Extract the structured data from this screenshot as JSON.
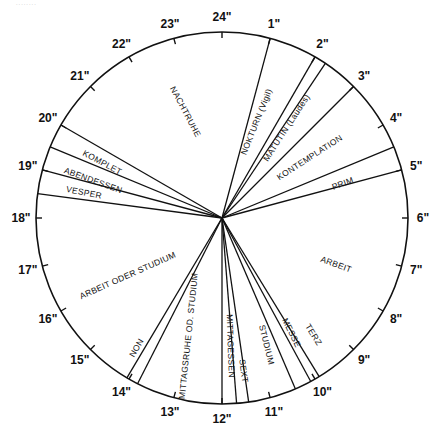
{
  "diagram": {
    "type": "24-hour clock day schedule",
    "caption_scrap": "........",
    "center": [
      222,
      218
    ],
    "radius": 186,
    "stroke_color": "#111111",
    "background": "#ffffff",
    "hour_ticks": [
      {
        "hour": 24,
        "label": "24\""
      },
      {
        "hour": 1,
        "label": "1\""
      },
      {
        "hour": 2,
        "label": "2\""
      },
      {
        "hour": 3,
        "label": "3\""
      },
      {
        "hour": 4,
        "label": "4\""
      },
      {
        "hour": 5,
        "label": "5\""
      },
      {
        "hour": 6,
        "label": "6\""
      },
      {
        "hour": 7,
        "label": "7\""
      },
      {
        "hour": 8,
        "label": "8\""
      },
      {
        "hour": 9,
        "label": "9\""
      },
      {
        "hour": 10,
        "label": "10\""
      },
      {
        "hour": 11,
        "label": "11\""
      },
      {
        "hour": 12,
        "label": "12\""
      },
      {
        "hour": 13,
        "label": "13\""
      },
      {
        "hour": 14,
        "label": "14\""
      },
      {
        "hour": 15,
        "label": "15\""
      },
      {
        "hour": 16,
        "label": "16\""
      },
      {
        "hour": 17,
        "label": "17\""
      },
      {
        "hour": 18,
        "label": "18\""
      },
      {
        "hour": 19,
        "label": "19\""
      },
      {
        "hour": 20,
        "label": "20\""
      },
      {
        "hour": 21,
        "label": "21\""
      },
      {
        "hour": 22,
        "label": "22\""
      },
      {
        "hour": 23,
        "label": "23\""
      }
    ],
    "divider_hours": [
      1.0,
      2.0,
      2.25,
      3.0,
      4.5,
      5.0,
      9.9,
      10.1,
      10.45,
      11.45,
      11.7,
      12.0,
      13.8,
      14.05,
      18.5,
      19.0,
      19.5,
      20.0
    ],
    "segments": [
      {
        "name": "NACHTRUHE",
        "start": 20.0,
        "end": 1.0,
        "label_pos": [
          185,
          112
        ],
        "rotate": 62
      },
      {
        "name": "NOKTURN (Vigil)",
        "start": 1.0,
        "end": 2.0,
        "label_pos": [
          257,
          122
        ],
        "rotate": -68
      },
      {
        "name": "MATUTIN (Laudes)",
        "start": 2.25,
        "end": 3.0,
        "label_pos": [
          287,
          128
        ],
        "rotate": -57
      },
      {
        "name": "KONTEMPLATION",
        "start": 3.0,
        "end": 4.5,
        "label_pos": [
          310,
          158
        ],
        "rotate": -33
      },
      {
        "name": "PRIM",
        "start": 4.5,
        "end": 5.0,
        "label_pos": [
          343,
          184
        ],
        "rotate": -20
      },
      {
        "name": "ARBEIT",
        "start": 5.0,
        "end": 9.9,
        "label_pos": [
          336,
          265
        ],
        "rotate": 20
      },
      {
        "name": "TERZ",
        "start": 9.9,
        "end": 10.1,
        "label_pos": [
          313,
          335
        ],
        "rotate": 58
      },
      {
        "name": "MESSE",
        "start": 10.1,
        "end": 10.45,
        "label_pos": [
          291,
          333
        ],
        "rotate": 64
      },
      {
        "name": "STUDIUM",
        "start": 10.45,
        "end": 11.45,
        "label_pos": [
          266,
          345
        ],
        "rotate": 76
      },
      {
        "name": "SEXT",
        "start": 11.45,
        "end": 11.7,
        "label_pos": [
          243,
          371
        ],
        "rotate": 82
      },
      {
        "name": "MITTAGESSEN",
        "start": 11.7,
        "end": 12.0,
        "label_pos": [
          230,
          346
        ],
        "rotate": 88
      },
      {
        "name": "MITTAGSRUHE OD. STUDIUM",
        "start": 12.0,
        "end": 13.8,
        "label_pos": [
          189,
          336
        ],
        "rotate": -84
      },
      {
        "name": "NON",
        "start": 13.8,
        "end": 14.05,
        "label_pos": [
          137,
          348
        ],
        "rotate": -60
      },
      {
        "name": "ARBEIT ODER STUDIUM",
        "start": 14.05,
        "end": 18.5,
        "label_pos": [
          128,
          276
        ],
        "rotate": -24
      },
      {
        "name": "VESPER",
        "start": 18.5,
        "end": 19.0,
        "label_pos": [
          84,
          193
        ],
        "rotate": 11
      },
      {
        "name": "ABENDESSEN",
        "start": 19.0,
        "end": 19.5,
        "label_pos": [
          93,
          181
        ],
        "rotate": 20
      },
      {
        "name": "KOMPLET",
        "start": 19.5,
        "end": 20.0,
        "label_pos": [
          102,
          163
        ],
        "rotate": 28
      }
    ]
  }
}
